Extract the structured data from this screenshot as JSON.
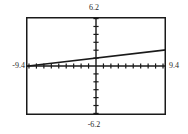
{
  "window": {
    "title": "Graphing Calculator Viewing Window"
  },
  "labels": {
    "ymax": "6.2",
    "ymin": "-6.2",
    "xmin": "-9.4",
    "xmax": "9.4"
  },
  "colors": {
    "frame": "#1a1a1a",
    "axis": "#1a1a1a",
    "curve": "#1a1a1a",
    "background": "#ffffff",
    "text": "#2a2a2a"
  },
  "chart_data": {
    "type": "line",
    "title": "",
    "xlabel": "",
    "ylabel": "",
    "xlim": [
      -9.4,
      9.4
    ],
    "ylim": [
      -6.2,
      6.2
    ],
    "grid": false,
    "legend": "none",
    "axes": {
      "x_axis_at_y": 0,
      "y_axis_at_x": 0,
      "x_tick_spacing": 1,
      "y_tick_spacing": 1,
      "x_ticks": [
        -9,
        -8,
        -7,
        -6,
        -5,
        -4,
        -3,
        -2,
        -1,
        1,
        2,
        3,
        4,
        5,
        6,
        7,
        8,
        9
      ],
      "y_ticks": [
        -6,
        -5,
        -4,
        -3,
        -2,
        -1,
        1,
        2,
        3,
        4,
        5,
        6
      ]
    },
    "series": [
      {
        "name": "line",
        "equation": "y = 0.111x + 1.0",
        "slope": 0.111,
        "intercept": 1.0,
        "x": [
          -9.4,
          9.4
        ],
        "values": [
          -0.04,
          2.04
        ]
      }
    ],
    "annotations": [
      {
        "text": "6.2",
        "position": "top-center",
        "meaning": "Ymax"
      },
      {
        "text": "-6.2",
        "position": "bottom-center",
        "meaning": "Ymin"
      },
      {
        "text": "-9.4",
        "position": "left-middle",
        "meaning": "Xmin"
      },
      {
        "text": "9.4",
        "position": "right-middle",
        "meaning": "Xmax"
      }
    ]
  }
}
